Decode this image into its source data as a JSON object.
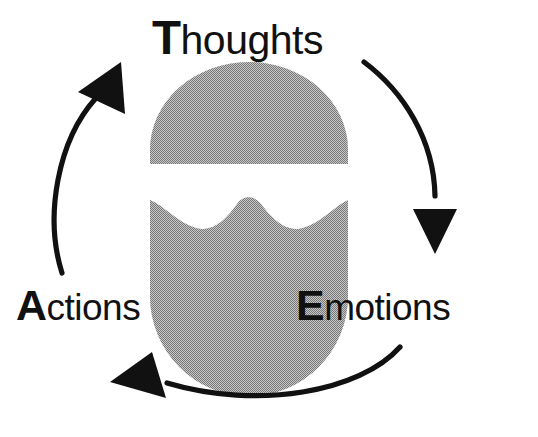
{
  "diagram": {
    "type": "cycle-diagram",
    "nodes": [
      {
        "id": "thoughts",
        "initial": "T",
        "rest": "houghts",
        "full_label": "Thoughts",
        "position": "top"
      },
      {
        "id": "emotions",
        "initial": "E",
        "rest": "motions",
        "full_label": "Emotions",
        "position": "bottom-right"
      },
      {
        "id": "actions",
        "initial": "A",
        "rest": "ctions",
        "full_label": "Actions",
        "position": "bottom-left"
      }
    ],
    "arrows": [
      {
        "id": "thoughts-to-emotions",
        "from": "thoughts",
        "to": "emotions",
        "side": "right",
        "direction": "down"
      },
      {
        "id": "emotions-to-actions",
        "from": "emotions",
        "to": "actions",
        "side": "bottom",
        "direction": "left"
      },
      {
        "id": "actions-to-thoughts",
        "from": "actions",
        "to": "thoughts",
        "side": "left",
        "direction": "up"
      }
    ],
    "center_graphic": {
      "name": "head-silhouette",
      "parts": [
        "skull-cap-dome",
        "lower-head-with-wave"
      ],
      "fill_color": "#9a9a9a"
    },
    "colors": {
      "background": "#ffffff",
      "ink": "#111111",
      "head_gray": "#9a9a9a"
    }
  }
}
